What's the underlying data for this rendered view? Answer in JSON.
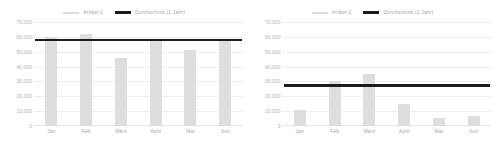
{
  "charts": [
    {
      "legend": {
        "series_label": "Artikel 1",
        "average_label": "Durchschnitt (1 Jahr)",
        "series_color": "#dcdcdc",
        "average_color": "#1a1a1a"
      },
      "y_ticks": [
        "70.000",
        "60.000",
        "50.000",
        "40.000",
        "30.000",
        "20.000",
        "10.000",
        "0"
      ],
      "x_ticks": [
        "Jan",
        "Feb",
        "März",
        "April",
        "Mai",
        "Juni"
      ]
    },
    {
      "legend": {
        "series_label": "Artikel 2",
        "average_label": "Durchschnitt (1 Jahr)",
        "series_color": "#dcdcdc",
        "average_color": "#1a1a1a"
      },
      "y_ticks": [
        "70.000",
        "60.000",
        "50.000",
        "40.000",
        "30.000",
        "20.000",
        "10.000",
        "0"
      ],
      "x_ticks": [
        "Jan",
        "Feb",
        "März",
        "April",
        "Mai",
        "Juni"
      ]
    }
  ],
  "chart_data": [
    {
      "type": "bar",
      "title": "",
      "xlabel": "",
      "ylabel": "",
      "categories": [
        "Jan",
        "Feb",
        "März",
        "April",
        "Mai",
        "Juni"
      ],
      "series": [
        {
          "name": "Artikel 1",
          "type": "bar",
          "color": "#dedede",
          "values": [
            60000,
            62000,
            45500,
            57000,
            51000,
            57500
          ]
        },
        {
          "name": "Durchschnitt (1 Jahr)",
          "type": "line",
          "color": "#1c1c1c",
          "constant": 57200
        }
      ],
      "ylim": [
        0,
        70000
      ],
      "ytick_values": [
        70000,
        60000,
        50000,
        40000,
        30000,
        20000,
        10000,
        0
      ],
      "ytick_labels": [
        "70.000",
        "60.000",
        "50.000",
        "40.000",
        "30.000",
        "20.000",
        "10.000",
        "0"
      ],
      "grid": true,
      "legend_position": "top-center"
    },
    {
      "type": "bar",
      "title": "",
      "xlabel": "",
      "ylabel": "",
      "categories": [
        "Jan",
        "Feb",
        "März",
        "April",
        "Mai",
        "Juni"
      ],
      "series": [
        {
          "name": "Artikel 2",
          "type": "bar",
          "color": "#dedede",
          "values": [
            11000,
            30000,
            35000,
            14500,
            5500,
            6500
          ]
        },
        {
          "name": "Durchschnitt (1 Jahr)",
          "type": "line",
          "color": "#1c1c1c",
          "constant": 26500
        }
      ],
      "ylim": [
        0,
        70000
      ],
      "ytick_values": [
        70000,
        60000,
        50000,
        40000,
        30000,
        20000,
        10000,
        0
      ],
      "ytick_labels": [
        "70.000",
        "60.000",
        "50.000",
        "40.000",
        "30.000",
        "20.000",
        "10.000",
        "0"
      ],
      "grid": true,
      "legend_position": "top-center"
    }
  ]
}
